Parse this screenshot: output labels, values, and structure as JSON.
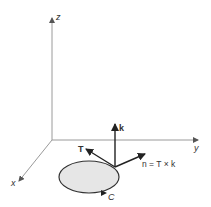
{
  "figure": {
    "type": "3d-coordinate-diagram",
    "colors": {
      "background": "#ffffff",
      "axis": "#9a9a9a",
      "vector": "#222222",
      "region_fill": "#e6e6e6",
      "curve": "#333333",
      "text": "#333333"
    },
    "axes": {
      "z_label": "z",
      "y_label": "y",
      "x_label": "x"
    },
    "vectors": {
      "k_label": "k",
      "T_label": "T",
      "n_label": "n = T × k"
    },
    "curve": {
      "label": "C"
    }
  }
}
